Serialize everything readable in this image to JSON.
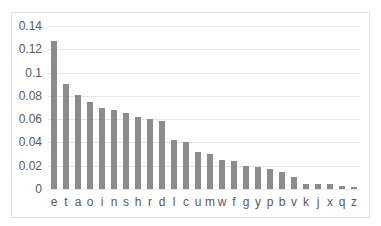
{
  "header_fragment": "",
  "chart_data": {
    "type": "bar",
    "title": "",
    "xlabel": "",
    "ylabel": "",
    "categories": [
      "e",
      "t",
      "a",
      "o",
      "i",
      "n",
      "s",
      "h",
      "r",
      "d",
      "l",
      "c",
      "u",
      "m",
      "w",
      "f",
      "g",
      "y",
      "p",
      "b",
      "v",
      "k",
      "j",
      "x",
      "q",
      "z"
    ],
    "values": [
      0.127,
      0.09,
      0.081,
      0.075,
      0.07,
      0.068,
      0.065,
      0.062,
      0.06,
      0.058,
      0.042,
      0.04,
      0.032,
      0.03,
      0.025,
      0.024,
      0.02,
      0.019,
      0.017,
      0.015,
      0.01,
      0.004,
      0.004,
      0.004,
      0.003,
      0.002
    ],
    "ylim": [
      0,
      0.14
    ],
    "yticks": [
      "0.14",
      "0.12",
      "0.1",
      "0.08",
      "0.06",
      "0.04",
      "0.02",
      "0"
    ],
    "grid": true,
    "legend": null,
    "bar_color": "#8c8c8c"
  }
}
